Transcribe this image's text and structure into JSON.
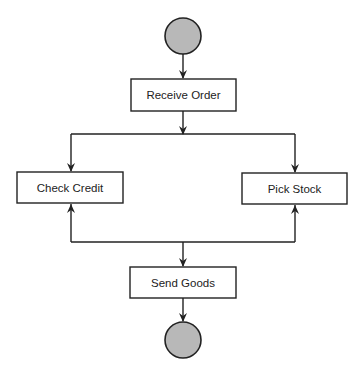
{
  "diagram": {
    "type": "activity-diagram",
    "colors": {
      "line": "#222222",
      "node_fill": "#ffffff",
      "terminal_fill": "#b8b8b8",
      "text": "#222222"
    },
    "start_node": {
      "id": "start",
      "kind": "initial",
      "cx": 183,
      "cy": 36,
      "r": 18
    },
    "end_node": {
      "id": "end",
      "kind": "final",
      "cx": 183,
      "cy": 340,
      "r": 18
    },
    "nodes": [
      {
        "id": "receive-order",
        "label": "Receive Order",
        "x": 131,
        "y": 79,
        "w": 105,
        "h": 32
      },
      {
        "id": "check-credit",
        "label": "Check Credit",
        "x": 17,
        "y": 172,
        "w": 106,
        "h": 31
      },
      {
        "id": "pick-stock",
        "label": "Pick Stock",
        "x": 242,
        "y": 173,
        "w": 105,
        "h": 31
      },
      {
        "id": "send-goods",
        "label": "Send Goods",
        "x": 130,
        "y": 267,
        "w": 106,
        "h": 31
      }
    ],
    "edges": [
      {
        "from": "start",
        "to": "receive-order"
      },
      {
        "from": "receive-order",
        "to": "check-credit"
      },
      {
        "from": "receive-order",
        "to": "pick-stock"
      },
      {
        "from": "send-goods-split",
        "to": "check-credit"
      },
      {
        "from": "send-goods-split",
        "to": "pick-stock"
      },
      {
        "from": "split",
        "to": "send-goods"
      },
      {
        "from": "send-goods",
        "to": "end"
      }
    ]
  }
}
